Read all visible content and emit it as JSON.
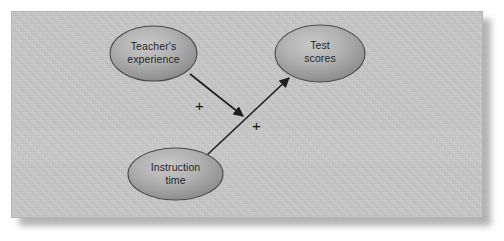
{
  "figure": {
    "name": "moderation-path-diagram",
    "background_color": "#ffffff",
    "panel_color": "#c9c9c9",
    "panel_border_color": "#b4b4b4",
    "shadow_color": "#9a9a9a"
  },
  "nodes": [
    {
      "id": "teachers-experience",
      "label": "Teacher's\nexperience",
      "cx": 153.5,
      "cy": 53.5,
      "rx": 43.5,
      "ry": 27.5,
      "fill_light": "#c3c3c3",
      "fill_dark": "#8f8f8f",
      "stroke": "#4a4a4a"
    },
    {
      "id": "test-scores",
      "label": "Test\nscores",
      "cx": 320,
      "cy": 53.5,
      "rx": 45,
      "ry": 28.5,
      "fill_light": "#c3c3c3",
      "fill_dark": "#8f8f8f",
      "stroke": "#4a4a4a"
    },
    {
      "id": "instruction-time",
      "label": "Instruction\ntime",
      "cx": 175.5,
      "cy": 174,
      "rx": 47.5,
      "ry": 26,
      "fill_light": "#c3c3c3",
      "fill_dark": "#8f8f8f",
      "stroke": "#4a4a4a"
    }
  ],
  "edges": [
    {
      "id": "instruction-to-test",
      "from": "instruction-time",
      "to": "test-scores",
      "sign": "+",
      "x1": 206,
      "y1": 156,
      "x2": 289,
      "y2": 78,
      "stroke": "#1f1f1f",
      "stroke_width": 1.6
    },
    {
      "id": "experience-moderates-path",
      "from": "teachers-experience",
      "to": "instruction-to-test",
      "sign": "+",
      "x1": 190,
      "y1": 74,
      "x2": 243,
      "y2": 116,
      "stroke": "#1f1f1f",
      "stroke_width": 1.6
    }
  ],
  "signs": {
    "moderation": "+",
    "main_effect": "+"
  }
}
